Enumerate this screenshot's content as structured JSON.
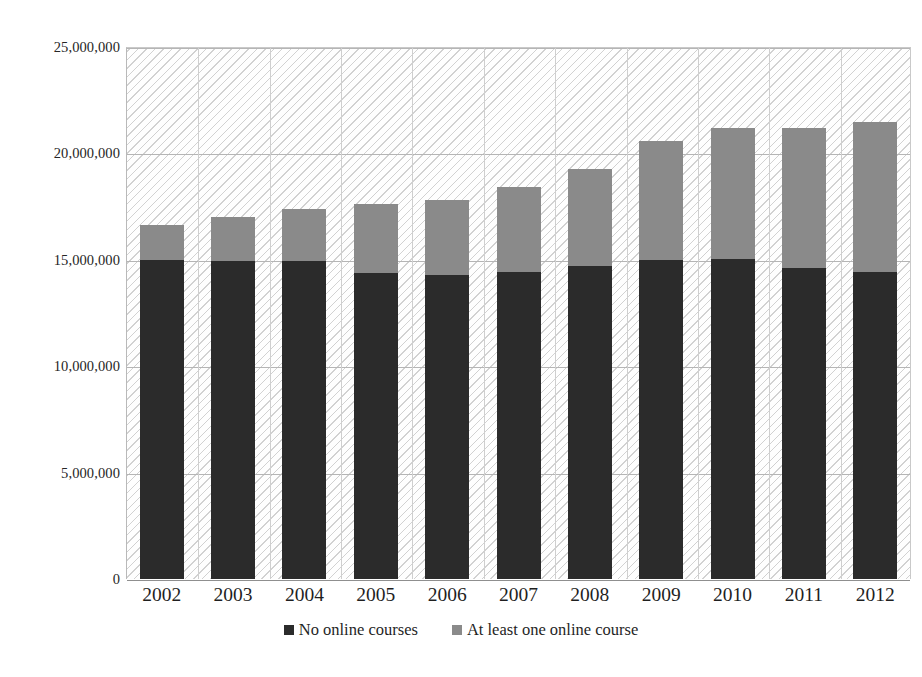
{
  "chart_data": {
    "type": "bar",
    "subtype": "stacked-column",
    "title": "",
    "xlabel": "",
    "ylabel": "",
    "categories": [
      "2002",
      "2003",
      "2004",
      "2005",
      "2006",
      "2007",
      "2008",
      "2009",
      "2010",
      "2011",
      "2012"
    ],
    "series": [
      {
        "name": "No online courses",
        "color": "#2b2b2b",
        "values": [
          15000000,
          14950000,
          14950000,
          14400000,
          14300000,
          14450000,
          14700000,
          15000000,
          15050000,
          14600000,
          14450000
        ]
      },
      {
        "name": "At least one online course",
        "color": "#8a8a8a",
        "values": [
          1650000,
          2050000,
          2450000,
          3200000,
          3500000,
          3950000,
          4550000,
          5600000,
          6150000,
          6600000,
          7050000
        ]
      }
    ],
    "totals": [
      16650000,
      17000000,
      17400000,
      17600000,
      17800000,
      18400000,
      19250000,
      20600000,
      21200000,
      21200000,
      21500000
    ],
    "ylim": [
      0,
      25000000
    ],
    "yticks": [
      0,
      5000000,
      10000000,
      15000000,
      20000000,
      25000000
    ],
    "ytick_labels": [
      "0",
      "5,000,000",
      "10,000,000",
      "15,000,000",
      "20,000,000",
      "25,000,000"
    ],
    "grid": true,
    "grid_axis": "both",
    "legend_position": "bottom",
    "plot_background": "#f3f3f3",
    "plot_pattern": "diagonal-hatch"
  },
  "legend": {
    "items": [
      {
        "label": "No online courses",
        "swatch": "dark"
      },
      {
        "label": "At least one online course",
        "swatch": "gray"
      }
    ]
  }
}
